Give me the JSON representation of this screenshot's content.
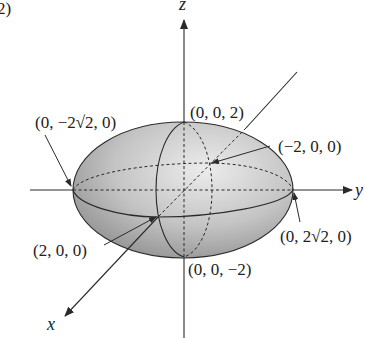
{
  "figure": {
    "part_label": "2)",
    "axes": {
      "x": "x",
      "y": "y",
      "z": "z"
    },
    "points": {
      "neg_y": "(0, −2√2, 0)",
      "pos_z": "(0, 0, 2)",
      "neg_x": "(−2, 0, 0)",
      "pos_x": "(2, 0, 0)",
      "pos_y": "(0, 2√2, 0)",
      "neg_z": "(0, 0, −2)"
    },
    "colors": {
      "line": "#2a2a2a",
      "shade_dark": "#8a8a8a",
      "shade_light": "#e6e6e6",
      "background": "#ffffff"
    }
  }
}
